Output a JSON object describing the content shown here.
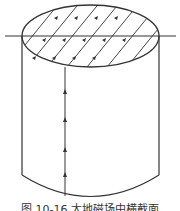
{
  "figure": {
    "stroke_color": "#333333",
    "horizontal_line_y": 36,
    "caption": "图 10-16  大地磁场中横截面"
  }
}
